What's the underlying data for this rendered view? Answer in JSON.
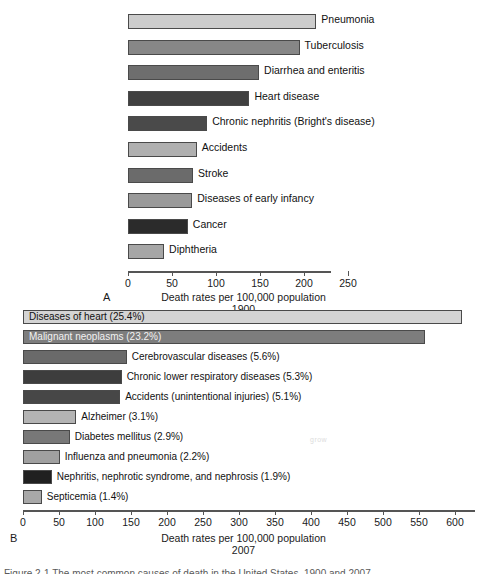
{
  "figure": {
    "caption_clipped": "Figure 2-1   The most common causes of death in the United States, 1900 and 2007."
  },
  "panel_a": {
    "letter": "A",
    "axis_title": "Death rates per 100,000 population",
    "year": "1900",
    "ghost_text": "",
    "chart_data": {
      "type": "bar",
      "orientation": "horizontal",
      "title": "",
      "xlabel": "Death rates per 100,000 population",
      "ylabel": "",
      "xlim": [
        0,
        275
      ],
      "xticks": [
        0,
        50,
        100,
        150,
        200,
        250
      ],
      "grid": false,
      "legend": "none",
      "categories": [
        "Pneumonia",
        "Tuberculosis",
        "Diarrhea and enteritis",
        "Heart disease",
        "Chronic nephritis (Bright's disease)",
        "Accidents",
        "Stroke",
        "Diseases of early infancy",
        "Cancer",
        "Diphtheria"
      ],
      "values": [
        214,
        195,
        149,
        138,
        90,
        78,
        74,
        73,
        68,
        41
      ],
      "bar_colors": [
        "#cccccc",
        "#878787",
        "#6e6e6e",
        "#404040",
        "#4a4a4a",
        "#b0b0b0",
        "#6b6b6b",
        "#9a9a9a",
        "#2b2b2b",
        "#a6a6a6"
      ]
    }
  },
  "panel_b": {
    "letter": "B",
    "axis_title": "Death rates per 100,000 population",
    "year": "2007",
    "ghost_text": "grow",
    "chart_data": {
      "type": "bar",
      "orientation": "horizontal",
      "title": "",
      "xlabel": "Death rates per 100,000 population",
      "ylabel": "",
      "xlim": [
        0,
        630
      ],
      "xticks": [
        0,
        50,
        100,
        150,
        200,
        250,
        300,
        350,
        400,
        450,
        500,
        550,
        600
      ],
      "grid": false,
      "legend": "none",
      "categories": [
        "Diseases of heart (25.4%)",
        "Malignant neoplasms (23.2%)",
        "Cerebrovascular diseases (5.6%)",
        "Chronic lower respiratory diseases (5.3%)",
        "Accidents (unintentional injuries) (5.1%)",
        "Alzheimer (3.1%)",
        "Diabetes mellitus (2.9%)",
        "Influenza and pneumonia (2.2%)",
        "Nephritis, nephrotic syndrome, and nephrosis (1.9%)",
        "Septicemia (1.4%)"
      ],
      "values": [
        610,
        558,
        144,
        137,
        135,
        74,
        65,
        51,
        40,
        26
      ],
      "percents": [
        "25.4%",
        "23.2%",
        "5.6%",
        "5.3%",
        "5.1%",
        "3.1%",
        "2.9%",
        "2.2%",
        "1.9%",
        "1.4%"
      ],
      "bar_colors": [
        "#d4d4d4",
        "#7d7d7d",
        "#6a6a6a",
        "#3d3d3d",
        "#474747",
        "#b4b4b4",
        "#787878",
        "#a0a0a0",
        "#202020",
        "#a8a8a8"
      ],
      "label_placement": [
        "inside",
        "inside",
        "outside",
        "outside",
        "outside",
        "outside",
        "outside",
        "outside",
        "outside",
        "outside"
      ]
    }
  }
}
